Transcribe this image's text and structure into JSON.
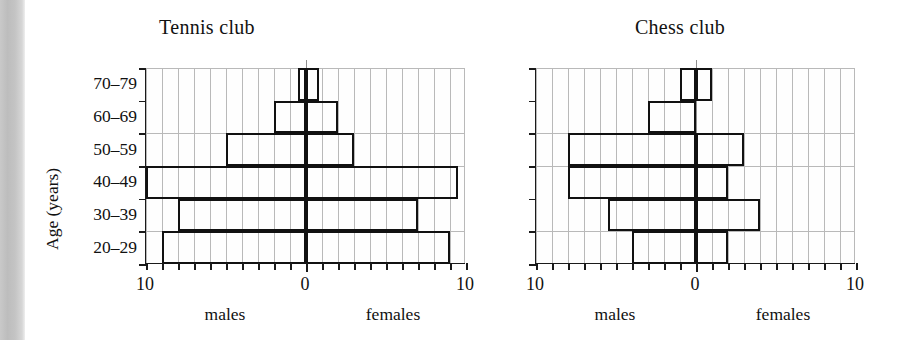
{
  "figure": {
    "background_color": "#ffffff",
    "line_color": "#111111",
    "grid_color": "#b9b9b9",
    "gutter_color": "#c6c6c6"
  },
  "axis": {
    "y_title": "Age (years)",
    "categories": [
      "20–29",
      "30–39",
      "40–49",
      "50–59",
      "60–69",
      "70–79"
    ],
    "x_left_label": "10",
    "x_center_label": "0",
    "x_right_label": "10",
    "left_caption": "males",
    "right_caption": "females",
    "x_max": 10,
    "x_tick_step": 1
  },
  "charts": [
    {
      "id": "tennis",
      "title": "Tennis club",
      "show_y_axis_labels": true
    },
    {
      "id": "chess",
      "title": "Chess club",
      "show_y_axis_labels": false
    }
  ],
  "chart_data": [
    {
      "type": "bar",
      "subtype": "population-pyramid",
      "title": "Tennis club",
      "xlabel": "",
      "ylabel": "Age (years)",
      "categories": [
        "20–29",
        "30–39",
        "40–49",
        "50–59",
        "60–69",
        "70–79"
      ],
      "xlim": [
        -10,
        10
      ],
      "x_tick_labels_left_to_right": [
        "10",
        "0",
        "10"
      ],
      "grid": true,
      "legend": "none",
      "left_caption": "males",
      "right_caption": "females",
      "series": [
        {
          "name": "males",
          "side": "left",
          "values": [
            9,
            8,
            10,
            5,
            2,
            0.5
          ]
        },
        {
          "name": "females",
          "side": "right",
          "values": [
            9,
            7,
            9.5,
            3,
            2,
            0.8
          ]
        }
      ]
    },
    {
      "type": "bar",
      "subtype": "population-pyramid",
      "title": "Chess club",
      "xlabel": "",
      "ylabel": "Age (years)",
      "categories": [
        "20–29",
        "30–39",
        "40–49",
        "50–59",
        "60–69",
        "70–79"
      ],
      "xlim": [
        -10,
        10
      ],
      "x_tick_labels_left_to_right": [
        "10",
        "0",
        "10"
      ],
      "grid": true,
      "legend": "none",
      "left_caption": "males",
      "right_caption": "females",
      "series": [
        {
          "name": "males",
          "side": "left",
          "values": [
            4,
            5.5,
            8,
            8,
            3,
            1
          ]
        },
        {
          "name": "females",
          "side": "right",
          "values": [
            2,
            4,
            2,
            3,
            0,
            1
          ]
        }
      ]
    }
  ]
}
